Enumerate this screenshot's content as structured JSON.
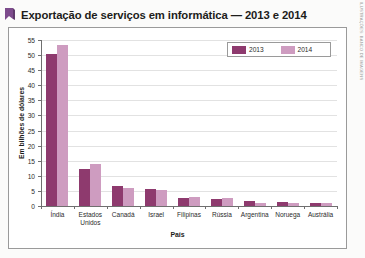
{
  "title": {
    "text": "Exportação de serviços em informática — 2013 e 2014",
    "mark_icon": "bookmark-mark-icon"
  },
  "credit": {
    "text": "ILUSTRAÇÕES: BANCO DE IMAGENS"
  },
  "legend": {
    "position": "top-right-inside",
    "entries": [
      {
        "label": "2013",
        "color": "#8e3a6e"
      },
      {
        "label": "2014",
        "color": "#ce9cc0"
      }
    ]
  },
  "axes": {
    "y": {
      "label": "Em bilhões de dólares",
      "ticks": [
        "0",
        "5",
        "10",
        "15",
        "20",
        "25",
        "30",
        "35",
        "40",
        "45",
        "50",
        "55"
      ],
      "min": 0,
      "max": 55,
      "step": 5
    },
    "x": {
      "label": "País"
    }
  },
  "chart_data": {
    "type": "bar",
    "title": "Exportação de serviços em informática — 2013 e 2014",
    "xlabel": "País",
    "ylabel": "Em bilhões de dólares",
    "ylim": [
      0,
      55
    ],
    "ytick_step": 5,
    "grid": true,
    "legend_position": "upper right",
    "categories": [
      "Índia",
      "Estados Unidos",
      "Canadá",
      "Israel",
      "Filipinas",
      "Rússia",
      "Argentina",
      "Noruega",
      "Austrália"
    ],
    "series": [
      {
        "name": "2013",
        "color": "#8e3a6e",
        "values": [
          50.5,
          12.3,
          6.5,
          5.5,
          2.7,
          2.4,
          1.6,
          1.4,
          1.0
        ]
      },
      {
        "name": "2014",
        "color": "#ce9cc0",
        "values": [
          53.5,
          13.8,
          6.0,
          5.4,
          3.0,
          2.5,
          1.0,
          1.1,
          1.1
        ]
      }
    ]
  }
}
